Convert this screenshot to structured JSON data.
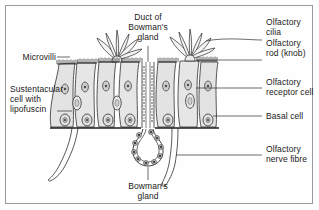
{
  "figure": {
    "frame_color": "#9a9a9a",
    "background_color": "#fefefe",
    "ink_color": "#1b1b1b",
    "cell_fill": "#e3e3e3",
    "cell_fill_light": "#eeeeee",
    "nucleus_fill": "#c9c9c9",
    "nucleus_dark": "#4a4a4a"
  },
  "labels": {
    "duct_of_bowmans_gland": "Duct of\nBowman's\ngland",
    "olfactory_cilia": "Olfactory\ncilia",
    "olfactory_rod_knob": "Olfactory\nrod (knob)",
    "olfactory_receptor_cell": "Olfactory\nreceptor cell",
    "basal_cell": "Basal cell",
    "olfactory_nerve_fibre": "Olfactory\nnerve fibre",
    "bowmans_gland": "Bowman's\ngland",
    "microvilli": "Microvilli",
    "sustentacular_cell": "Sustentacular\ncell with\nlipofuscin"
  },
  "structures": [
    {
      "name": "olfactory-cilia",
      "count": 2,
      "description": "radiating tapered cilia tufts at apical surface"
    },
    {
      "name": "olfactory-rod-knob",
      "description": "apical knob of receptor cell"
    },
    {
      "name": "microvilli",
      "description": "brush border on sustentacular cell apex"
    },
    {
      "name": "sustentacular-cell",
      "count": 6,
      "description": "tall columnar supporting cells"
    },
    {
      "name": "olfactory-receptor-cell",
      "description": "bipolar neuron with oval nucleus mid-layer"
    },
    {
      "name": "basal-cell",
      "description": "small rounded cells on basement membrane"
    },
    {
      "name": "basement-membrane",
      "description": "dark horizontal boundary line"
    },
    {
      "name": "duct-of-bowmans-gland",
      "description": "narrow channel of cuboidal cells descending through epithelium"
    },
    {
      "name": "bowmans-gland",
      "description": "ring of secretory cells with dark nuclei"
    },
    {
      "name": "olfactory-nerve-fibre",
      "count": 2,
      "description": "axon bundles descending below basement membrane"
    }
  ]
}
